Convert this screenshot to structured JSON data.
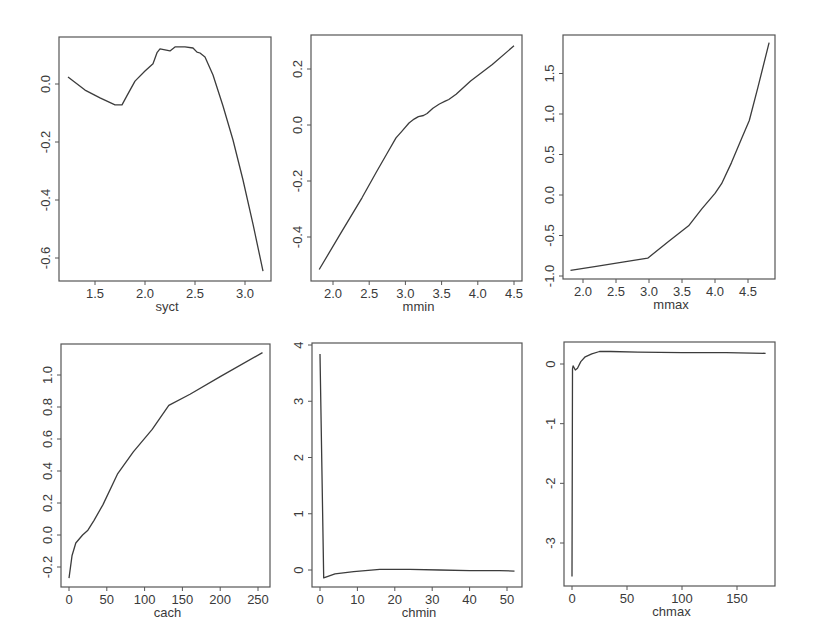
{
  "figure": {
    "layout": "2x3 grid of partial-dependence style line plots",
    "line_color": "#3c3c3c",
    "frame_color": "#555555"
  },
  "chart_data": [
    {
      "type": "line",
      "title": "",
      "xlabel": "syct",
      "ylabel": "",
      "frame": {
        "left": 59,
        "right": 271,
        "top": 37,
        "bottom": 281
      },
      "xmap": {
        "v0": 1.5,
        "p0": 95,
        "v1": 3.0,
        "p1": 245
      },
      "ymap": {
        "v0": 0.0,
        "p0": 84,
        "v1": -0.6,
        "p1": 258
      },
      "xticks": [
        1.5,
        2.0,
        2.5,
        3.0
      ],
      "xtick_labels": [
        "1.5",
        "2.0",
        "2.5",
        "3.0"
      ],
      "yticks": [
        0.0,
        -0.2,
        -0.4,
        -0.6
      ],
      "ytick_labels": [
        "0.0",
        "-0.2",
        "-0.4",
        "-0.6"
      ],
      "xlim": [
        1.14,
        3.26
      ],
      "ylim": [
        -0.68,
        0.16
      ],
      "grid": false,
      "x": [
        1.23,
        1.4,
        1.55,
        1.7,
        1.77,
        1.82,
        1.9,
        2.0,
        2.08,
        2.12,
        2.15,
        2.2,
        2.25,
        2.3,
        2.4,
        2.48,
        2.52,
        2.55,
        2.6,
        2.68,
        2.78,
        2.88,
        2.98,
        3.08,
        3.18
      ],
      "y": [
        0.024,
        -0.021,
        -0.048,
        -0.072,
        -0.072,
        -0.04,
        0.01,
        0.045,
        0.07,
        0.108,
        0.121,
        0.118,
        0.114,
        0.128,
        0.128,
        0.124,
        0.11,
        0.107,
        0.093,
        0.031,
        -0.076,
        -0.193,
        -0.331,
        -0.483,
        -0.645
      ]
    },
    {
      "type": "line",
      "title": "",
      "xlabel": "mmin",
      "ylabel": "",
      "frame": {
        "left": 311,
        "right": 522,
        "top": 35,
        "bottom": 281
      },
      "xmap": {
        "v0": 2.0,
        "p0": 333,
        "v1": 4.5,
        "p1": 514
      },
      "ymap": {
        "v0": 0.0,
        "p0": 125,
        "v1": 0.2,
        "p1": 69
      },
      "xticks": [
        2.0,
        2.5,
        3.0,
        3.5,
        4.0,
        4.5
      ],
      "xtick_labels": [
        "2.0",
        "2.5",
        "3.0",
        "3.5",
        "4.0",
        "4.5"
      ],
      "yticks": [
        0.2,
        0.0,
        -0.2,
        -0.4
      ],
      "ytick_labels": [
        "0.2",
        "0.0",
        "-0.2",
        "-0.4"
      ],
      "xlim": [
        1.7,
        4.61
      ],
      "ylim": [
        -0.56,
        0.32
      ],
      "grid": false,
      "x": [
        1.81,
        2.1,
        2.4,
        2.6,
        2.75,
        2.87,
        2.95,
        3.05,
        3.12,
        3.18,
        3.25,
        3.3,
        3.38,
        3.47,
        3.55,
        3.6,
        3.7,
        3.9,
        4.2,
        4.5
      ],
      "y": [
        -0.516,
        -0.39,
        -0.26,
        -0.168,
        -0.1,
        -0.046,
        -0.023,
        0.007,
        0.021,
        0.03,
        0.034,
        0.041,
        0.06,
        0.075,
        0.085,
        0.091,
        0.11,
        0.157,
        0.216,
        0.283
      ]
    },
    {
      "type": "line",
      "title": "",
      "xlabel": "mmax",
      "ylabel": "",
      "frame": {
        "left": 563,
        "right": 775,
        "top": 35,
        "bottom": 279
      },
      "xmap": {
        "v0": 2.0,
        "p0": 583,
        "v1": 4.5,
        "p1": 748
      },
      "ymap": {
        "v0": 0.0,
        "p0": 195,
        "v1": 1.0,
        "p1": 114
      },
      "xticks": [
        2.0,
        2.5,
        3.0,
        3.5,
        4.0,
        4.5
      ],
      "xtick_labels": [
        "2.0",
        "2.5",
        "3.0",
        "3.5",
        "4.0",
        "4.5"
      ],
      "yticks": [
        -1.0,
        -0.5,
        0.0,
        0.5,
        1.0,
        1.5
      ],
      "ytick_labels": [
        "-1.0",
        "-0.5",
        "0.0",
        "0.5",
        "1.0",
        "1.5"
      ],
      "xlim": [
        1.7,
        4.91
      ],
      "ylim": [
        -1.04,
        1.98
      ],
      "grid": false,
      "x": [
        1.81,
        2.2,
        2.6,
        2.98,
        3.3,
        3.6,
        3.8,
        4.0,
        4.1,
        4.25,
        4.4,
        4.52,
        4.65,
        4.82
      ],
      "y": [
        -0.93,
        -0.88,
        -0.83,
        -0.78,
        -0.57,
        -0.38,
        -0.17,
        0.02,
        0.14,
        0.4,
        0.69,
        0.92,
        1.33,
        1.88
      ]
    },
    {
      "type": "line",
      "title": "",
      "xlabel": "cach",
      "ylabel": "",
      "frame": {
        "left": 61,
        "right": 270,
        "top": 344,
        "bottom": 587
      },
      "xmap": {
        "v0": 0,
        "p0": 69,
        "v1": 250,
        "p1": 258
      },
      "ymap": {
        "v0": 0.0,
        "p0": 535,
        "v1": 1.0,
        "p1": 375
      },
      "xticks": [
        0,
        50,
        100,
        150,
        200,
        250
      ],
      "xtick_labels": [
        "0",
        "50",
        "100",
        "150",
        "200",
        "250"
      ],
      "yticks": [
        -0.2,
        0.0,
        0.2,
        0.4,
        0.6,
        0.8,
        1.0
      ],
      "ytick_labels": [
        "-0.2",
        "0.0",
        "0.2",
        "0.4",
        "0.6",
        "0.8",
        "1.0"
      ],
      "xlim": [
        -10,
        266
      ],
      "ylim": [
        -0.33,
        1.19
      ],
      "grid": false,
      "x": [
        0,
        4,
        9,
        18,
        25,
        33,
        45,
        64,
        85,
        110,
        132,
        160,
        200,
        256
      ],
      "y": [
        -0.27,
        -0.13,
        -0.05,
        0.0,
        0.03,
        0.09,
        0.19,
        0.38,
        0.52,
        0.66,
        0.81,
        0.88,
        0.99,
        1.14
      ]
    },
    {
      "type": "line",
      "title": "",
      "xlabel": "chmin",
      "ylabel": "",
      "frame": {
        "left": 312,
        "right": 522,
        "top": 343,
        "bottom": 587
      },
      "xmap": {
        "v0": 0,
        "p0": 320,
        "v1": 50,
        "p1": 507
      },
      "ymap": {
        "v0": 0,
        "p0": 570,
        "v1": 4,
        "p1": 345
      },
      "xticks": [
        0,
        10,
        20,
        30,
        40,
        50
      ],
      "xtick_labels": [
        "0",
        "10",
        "20",
        "30",
        "40",
        "50"
      ],
      "yticks": [
        0,
        1,
        2,
        3,
        4
      ],
      "ytick_labels": [
        "0",
        "1",
        "2",
        "3",
        "4"
      ],
      "xlim": [
        -2.1,
        54.0
      ],
      "ylim": [
        -0.3,
        4.04
      ],
      "grid": false,
      "x": [
        0,
        1,
        4,
        9,
        16,
        24,
        32,
        40,
        48,
        52
      ],
      "y": [
        3.84,
        -0.14,
        -0.07,
        -0.03,
        0.01,
        0.01,
        0.0,
        -0.01,
        -0.01,
        -0.02
      ]
    },
    {
      "type": "line",
      "title": "",
      "xlabel": "chmax",
      "ylabel": "",
      "frame": {
        "left": 564,
        "right": 775,
        "top": 342,
        "bottom": 586
      },
      "xmap": {
        "v0": 0,
        "p0": 572,
        "v1": 150,
        "p1": 737
      },
      "ymap": {
        "v0": 0,
        "p0": 364,
        "v1": -3,
        "p1": 543
      },
      "xticks": [
        0,
        50,
        100,
        150
      ],
      "xtick_labels": [
        "0",
        "50",
        "100",
        "150"
      ],
      "yticks": [
        0,
        -1,
        -2,
        -3
      ],
      "ytick_labels": [
        "0",
        "-1",
        "-2",
        "-3"
      ],
      "xlim": [
        -7.3,
        184.5
      ],
      "ylim": [
        -3.72,
        0.37
      ],
      "grid": false,
      "x": [
        0,
        0.5,
        1,
        3,
        5,
        8,
        12,
        18,
        25,
        35,
        60,
        100,
        140,
        176
      ],
      "y": [
        -3.56,
        -0.08,
        -0.03,
        -0.1,
        -0.07,
        0.04,
        0.12,
        0.17,
        0.21,
        0.21,
        0.2,
        0.19,
        0.19,
        0.18
      ]
    }
  ]
}
